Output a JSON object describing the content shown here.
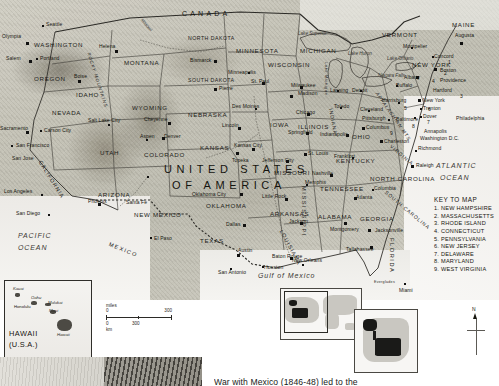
{
  "map": {
    "title": "UNITED STATES OF AMERICA",
    "country_label_line1": "UNITED STATES",
    "country_label_line2": "OF AMERICA",
    "neighbors": [
      {
        "name": "CANADA",
        "id": "canada"
      },
      {
        "name": "MEXICO",
        "id": "mexico"
      }
    ],
    "oceans": [
      {
        "name": "PACIFIC",
        "name2": "OCEAN",
        "id": "pacific-ocean"
      },
      {
        "name": "ATLANTIC",
        "name2": "OCEAN",
        "id": "atlantic-ocean"
      }
    ],
    "seas": [
      {
        "name": "Gulf of Mexico",
        "id": "gulf-of-mexico"
      }
    ],
    "lakes": [
      {
        "name": "Lake Superior"
      },
      {
        "name": "Lake Huron"
      },
      {
        "name": "Lake Michigan"
      },
      {
        "name": "Lake Ontario"
      },
      {
        "name": "Lake Erie"
      },
      {
        "name": "Niagara Falls"
      }
    ],
    "ranges": [
      {
        "name": "ROCKY MOUNTAINS"
      },
      {
        "name": "APPALACHIAN MTS"
      },
      {
        "name": "Missouri"
      }
    ],
    "states": [
      {
        "name": "WASHINGTON"
      },
      {
        "name": "OREGON"
      },
      {
        "name": "IDAHO"
      },
      {
        "name": "MONTANA"
      },
      {
        "name": "WYOMING"
      },
      {
        "name": "NEVADA"
      },
      {
        "name": "UTAH"
      },
      {
        "name": "COLORADO"
      },
      {
        "name": "CALIFORNIA"
      },
      {
        "name": "ARIZONA"
      },
      {
        "name": "NEW MEXICO"
      },
      {
        "name": "NORTH DAKOTA"
      },
      {
        "name": "SOUTH DAKOTA"
      },
      {
        "name": "NEBRASKA"
      },
      {
        "name": "KANSAS"
      },
      {
        "name": "OKLAHOMA"
      },
      {
        "name": "TEXAS"
      },
      {
        "name": "MINNESOTA"
      },
      {
        "name": "IOWA"
      },
      {
        "name": "MISSOURI"
      },
      {
        "name": "ARKANSAS"
      },
      {
        "name": "LOUISIANA"
      },
      {
        "name": "WISCONSIN"
      },
      {
        "name": "ILLINOIS"
      },
      {
        "name": "MICHIGAN"
      },
      {
        "name": "INDIANA"
      },
      {
        "name": "OHIO"
      },
      {
        "name": "KENTUCKY"
      },
      {
        "name": "TENNESSEE"
      },
      {
        "name": "MISSISSIPPI"
      },
      {
        "name": "ALABAMA"
      },
      {
        "name": "GEORGIA"
      },
      {
        "name": "FLORIDA"
      },
      {
        "name": "SOUTH CAROLINA"
      },
      {
        "name": "NORTH CAROLINA"
      },
      {
        "name": "VIRGINIA"
      },
      {
        "name": "NEW YORK"
      },
      {
        "name": "VERMONT"
      },
      {
        "name": "MAINE"
      }
    ],
    "cities": [
      {
        "name": "Olympia"
      },
      {
        "name": "Seattle"
      },
      {
        "name": "Salem"
      },
      {
        "name": "Portland"
      },
      {
        "name": "Helena"
      },
      {
        "name": "Boise"
      },
      {
        "name": "Bismarck"
      },
      {
        "name": "Pierre"
      },
      {
        "name": "Salt Lake City"
      },
      {
        "name": "Cheyenne"
      },
      {
        "name": "Denver"
      },
      {
        "name": "Aspen"
      },
      {
        "name": "Sacramento"
      },
      {
        "name": "Carson City"
      },
      {
        "name": "San Francisco"
      },
      {
        "name": "San Jose"
      },
      {
        "name": "Los Angeles"
      },
      {
        "name": "San Diego"
      },
      {
        "name": "Phoenix"
      },
      {
        "name": "Santa Fe"
      },
      {
        "name": "El Paso"
      },
      {
        "name": "Lincoln"
      },
      {
        "name": "Topeka"
      },
      {
        "name": "Kansas City"
      },
      {
        "name": "Des Moines"
      },
      {
        "name": "Minneapolis"
      },
      {
        "name": "St. Paul"
      },
      {
        "name": "Madison"
      },
      {
        "name": "Milwaukee"
      },
      {
        "name": "Chicago"
      },
      {
        "name": "Springfield"
      },
      {
        "name": "Indianapolis"
      },
      {
        "name": "Lansing"
      },
      {
        "name": "Detroit"
      },
      {
        "name": "Toledo"
      },
      {
        "name": "Cleveland"
      },
      {
        "name": "Columbus"
      },
      {
        "name": "Pittsburgh"
      },
      {
        "name": "Buffalo"
      },
      {
        "name": "Jefferson City"
      },
      {
        "name": "St. Louis"
      },
      {
        "name": "Frankfort"
      },
      {
        "name": "Nashville"
      },
      {
        "name": "Memphis"
      },
      {
        "name": "Little Rock"
      },
      {
        "name": "Oklahoma City"
      },
      {
        "name": "Dallas"
      },
      {
        "name": "Austin"
      },
      {
        "name": "San Antonio"
      },
      {
        "name": "Houston"
      },
      {
        "name": "Baton Rouge"
      },
      {
        "name": "New Orleans"
      },
      {
        "name": "Jackson"
      },
      {
        "name": "Montgomery"
      },
      {
        "name": "Tallahassee"
      },
      {
        "name": "Jacksonville"
      },
      {
        "name": "Miami"
      },
      {
        "name": "Everglades"
      },
      {
        "name": "Atlanta"
      },
      {
        "name": "Columbia"
      },
      {
        "name": "Raleigh"
      },
      {
        "name": "Richmond"
      },
      {
        "name": "Charleston"
      },
      {
        "name": "Washington D.C."
      },
      {
        "name": "Annapolis"
      },
      {
        "name": "Baltimore"
      },
      {
        "name": "Dover"
      },
      {
        "name": "Philadelphia"
      },
      {
        "name": "Trenton"
      },
      {
        "name": "New York"
      },
      {
        "name": "Harrisburg"
      },
      {
        "name": "Hartford"
      },
      {
        "name": "Providence"
      },
      {
        "name": "Boston"
      },
      {
        "name": "Concord"
      },
      {
        "name": "Montpelier"
      },
      {
        "name": "Albany"
      },
      {
        "name": "Augusta"
      }
    ]
  },
  "key": {
    "title": "KEY TO MAP",
    "items": [
      "1. NEW HAMPSHIRE",
      "2. MASSACHUSETTS",
      "3. RHODE ISLAND",
      "4. CONNECTICUT",
      "5. PENNSYLVANIA",
      "6. NEW JERSEY",
      "7. DELAWARE",
      "8. MARYLAND",
      "9. WEST VIRGINIA"
    ]
  },
  "hawaii_inset": {
    "title": "HAWAII",
    "subtitle": "(U.S.A.)",
    "islands": [
      "Kauai",
      "Oahu",
      "Molokai",
      "Maui",
      "Hawaii"
    ],
    "city": "Honolulu"
  },
  "scale": {
    "unit_top": "miles",
    "unit_bottom": "km",
    "top_start": "0",
    "top_end": "300",
    "bottom_start": "0",
    "bottom_mid": "300"
  },
  "compass": {
    "north_label": "N"
  },
  "caption": {
    "text": "War with Mexico (1846-48) led to the"
  }
}
